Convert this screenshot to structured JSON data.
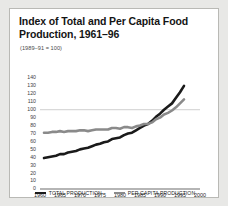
{
  "figure": {
    "title": "Index of Total and Per Capita Food Production, 1961–96",
    "subtitle": "(1989–91 = 100)",
    "background": "#ffffff",
    "page_background": "#e8e8e6",
    "border_color": "#b9b9b5"
  },
  "chart_data": {
    "type": "line",
    "title": "Index of Total and Per Capita Food Production, 1961–96",
    "subtitle": "(1989–91 = 100)",
    "xlabel": "",
    "ylabel": "",
    "xlim": [
      1960,
      2000
    ],
    "ylim": [
      0,
      145
    ],
    "yticks": [
      0,
      10,
      20,
      30,
      40,
      50,
      60,
      70,
      80,
      90,
      100,
      110,
      120,
      130,
      140
    ],
    "xticks": [
      1960,
      1965,
      1970,
      1975,
      1980,
      1985,
      1990,
      1995,
      2000
    ],
    "gridlines": [
      "y=100 reference line"
    ],
    "legend_position": "bottom-center",
    "x": [
      1961,
      1962,
      1963,
      1964,
      1965,
      1966,
      1967,
      1968,
      1969,
      1970,
      1971,
      1972,
      1973,
      1974,
      1975,
      1976,
      1977,
      1978,
      1979,
      1980,
      1981,
      1982,
      1983,
      1984,
      1985,
      1986,
      1987,
      1988,
      1989,
      1990,
      1991,
      1992,
      1993,
      1994,
      1995,
      1996
    ],
    "series": [
      {
        "name": "TOTAL PRODUCTION",
        "color": "#1a1a1a",
        "values": [
          39,
          40,
          41,
          42,
          44,
          44,
          46,
          47,
          48,
          50,
          51,
          52,
          54,
          56,
          57,
          59,
          60,
          63,
          64,
          65,
          68,
          70,
          71,
          74,
          77,
          80,
          82,
          86,
          91,
          95,
          100,
          104,
          108,
          115,
          122,
          130
        ]
      },
      {
        "name": "PER CAPITA PRODUCTION",
        "color": "#8a8a8a",
        "values": [
          71,
          71,
          72,
          72,
          73,
          72,
          73,
          73,
          73,
          74,
          74,
          73,
          74,
          75,
          75,
          75,
          75,
          77,
          77,
          76,
          78,
          78,
          77,
          79,
          80,
          82,
          82,
          84,
          88,
          90,
          94,
          96,
          99,
          103,
          108,
          113
        ]
      }
    ]
  },
  "legend": [
    {
      "label": "TOTAL PRODUCTION",
      "color": "#1a1a1a"
    },
    {
      "label": "PER CAPITA PRODUCTION",
      "color": "#8a8a8a"
    }
  ],
  "axis": {
    "y_tick_labels": [
      "140",
      "130",
      "120",
      "110",
      "100",
      "90",
      "80",
      "70",
      "60",
      "50",
      "40",
      "30",
      "20",
      "10",
      "0"
    ],
    "x_tick_labels": [
      "1960",
      "1965",
      "1970",
      "1975",
      "1980",
      "1985",
      "1990",
      "1995",
      "2000"
    ]
  }
}
